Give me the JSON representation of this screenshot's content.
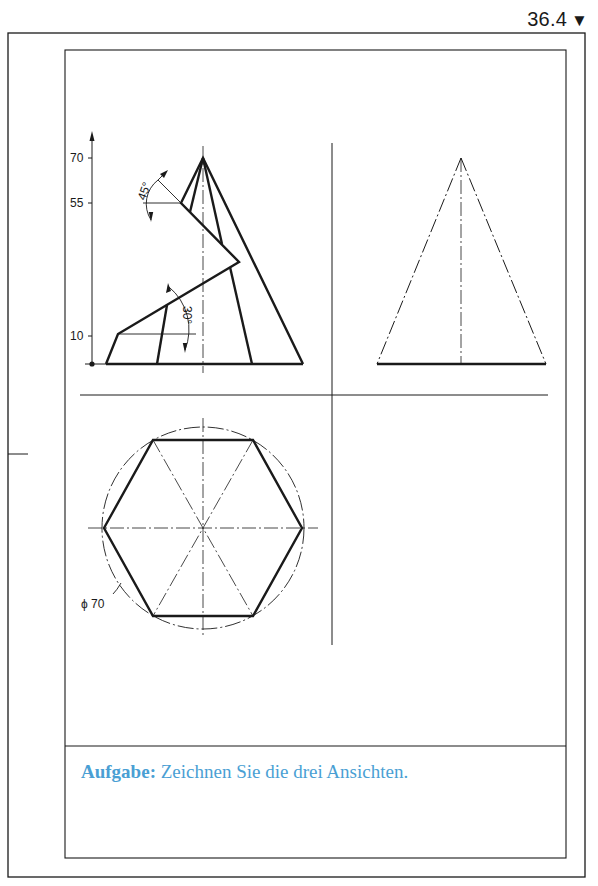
{
  "page": {
    "number": "36.4",
    "marker": "▼"
  },
  "views": {
    "front": {
      "dimensions": {
        "heights": [
          "70",
          "55",
          "10"
        ],
        "angle_top": "45°",
        "angle_bottom": "30°"
      }
    },
    "side": {},
    "top": {
      "diameter_label": "ϕ 70"
    }
  },
  "task": {
    "label": "Aufgabe",
    "separator": ":",
    "text": " Zeichnen Sie die drei Ansichten."
  },
  "colors": {
    "line": "#1a1a1a",
    "task_text": "#4a9fd4"
  }
}
